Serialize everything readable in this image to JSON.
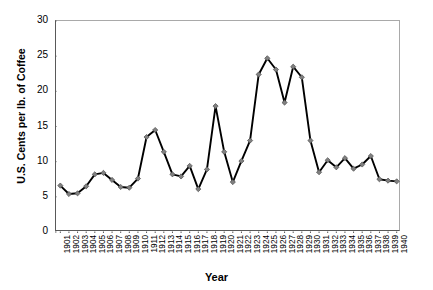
{
  "chart_data": {
    "type": "line",
    "title": "",
    "xlabel": "Year",
    "ylabel": "U.S. Cents per lb. of Coffee",
    "ylim": [
      0,
      30
    ],
    "yticks": [
      0,
      5,
      10,
      15,
      20,
      25,
      30
    ],
    "ytick_labels": [
      "0",
      "5",
      "10",
      "15",
      "20",
      "25",
      "30"
    ],
    "grid": false,
    "legend": null,
    "marker": "diamond",
    "line_color": "#000000",
    "marker_color": "#808080",
    "marker_edge_color": "#4d4d4d",
    "categories": [
      "1901",
      "1902",
      "1903",
      "1904",
      "1905",
      "1906",
      "1907",
      "1908",
      "1909",
      "1910",
      "1911",
      "1912",
      "1913",
      "1914",
      "1915",
      "1916",
      "1917",
      "1918",
      "1919",
      "1920",
      "1921",
      "1922",
      "1923",
      "1924",
      "1925",
      "1926",
      "1927",
      "1928",
      "1929",
      "1930",
      "1931",
      "1932",
      "1933",
      "1934",
      "1935",
      "1936",
      "1937",
      "1938",
      "1939",
      "1940"
    ],
    "values": [
      6.6,
      5.4,
      5.5,
      6.5,
      8.2,
      8.4,
      7.4,
      6.4,
      6.3,
      7.6,
      13.5,
      14.5,
      11.4,
      8.2,
      7.9,
      9.4,
      6.1,
      8.9,
      17.9,
      11.4,
      7.1,
      10.1,
      13.0,
      22.4,
      24.7,
      23.1,
      18.4,
      23.5,
      22.0,
      13.0,
      8.5,
      10.2,
      9.2,
      10.5,
      9.0,
      9.6,
      10.8,
      7.5,
      7.3,
      7.2
    ],
    "series": [
      {
        "name": "Coffee Price",
        "values": [
          6.6,
          5.4,
          5.5,
          6.5,
          8.2,
          8.4,
          7.4,
          6.4,
          6.3,
          7.6,
          13.5,
          14.5,
          11.4,
          8.2,
          7.9,
          9.4,
          6.1,
          8.9,
          17.9,
          11.4,
          7.1,
          10.1,
          13.0,
          22.4,
          24.7,
          23.1,
          18.4,
          23.5,
          22.0,
          13.0,
          8.5,
          10.2,
          9.2,
          10.5,
          9.0,
          9.6,
          10.8,
          7.5,
          7.3,
          7.2
        ]
      }
    ]
  }
}
